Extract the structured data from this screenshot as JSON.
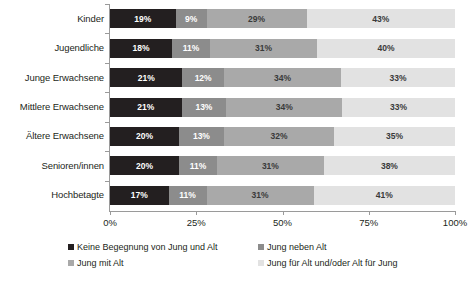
{
  "chart_data": {
    "type": "bar",
    "orientation": "horizontal",
    "stacked": true,
    "stack_mode": "percent",
    "title": "",
    "xlabel": "",
    "ylabel": "",
    "xlim": [
      0,
      100
    ],
    "grid": false,
    "legend_position": "bottom",
    "categories": [
      "Kinder",
      "Jugendliche",
      "Junge Erwachsene",
      "Mittlere Erwachsene",
      "Ältere Erwachsene",
      "Senioren/innen",
      "Hochbetagte"
    ],
    "xticks": [
      "0%",
      "25%",
      "50%",
      "75%",
      "100%"
    ],
    "xtick_values": [
      0,
      25,
      50,
      75,
      100
    ],
    "series": [
      {
        "name": "Keine Begegnung von Jung und Alt",
        "color": "#231f20",
        "values": [
          19,
          18,
          21,
          21,
          20,
          20,
          17
        ],
        "labels": [
          "19%",
          "18%",
          "21%",
          "21%",
          "20%",
          "20%",
          "17%"
        ]
      },
      {
        "name": "Jung neben Alt",
        "color": "#8c8c8c",
        "values": [
          9,
          11,
          12,
          13,
          13,
          11,
          11
        ],
        "labels": [
          "9%",
          "11%",
          "12%",
          "13%",
          "13%",
          "11%",
          "11%"
        ]
      },
      {
        "name": "Jung mit Alt",
        "color": "#a9a9a9",
        "values": [
          29,
          31,
          34,
          34,
          32,
          31,
          31
        ],
        "labels": [
          "29%",
          "31%",
          "34%",
          "34%",
          "32%",
          "31%",
          "31%"
        ]
      },
      {
        "name": "Jung für Alt und/oder Alt für Jung",
        "color": "#e2e2e2",
        "values": [
          43,
          40,
          33,
          33,
          35,
          38,
          41
        ],
        "labels": [
          "43%",
          "40%",
          "33%",
          "33%",
          "35%",
          "38%",
          "41%"
        ]
      }
    ]
  }
}
